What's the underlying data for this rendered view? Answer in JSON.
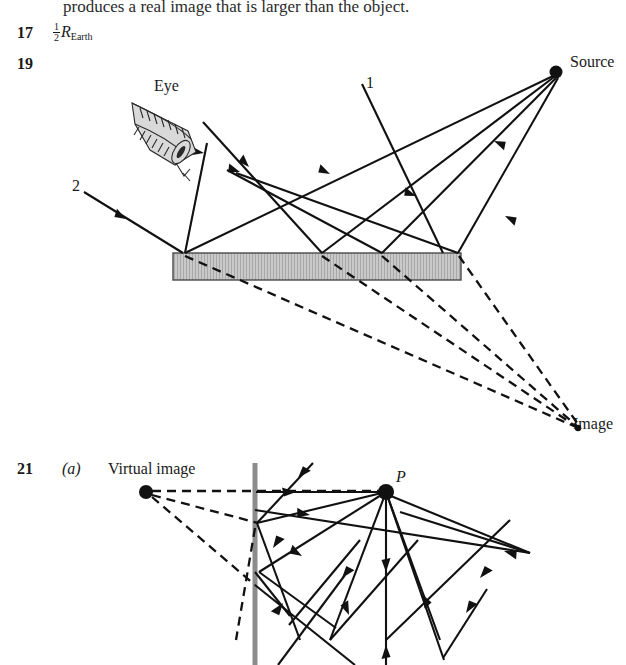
{
  "page": {
    "width": 626,
    "height": 665,
    "background": "#ffffff",
    "ink": "#1a1a1a"
  },
  "cut_off_line": {
    "text": "produces a real image that is larger than the object."
  },
  "answers": [
    {
      "number": "17",
      "formula": {
        "fraction_numerator": "1",
        "fraction_denominator": "2",
        "symbol": "R",
        "subscript": "Earth"
      }
    },
    {
      "number": "19",
      "diagram": {
        "name": "plane-mirror-ray-diagram",
        "labels": {
          "eye": "Eye",
          "source": "Source",
          "image": "Image",
          "ray_one": "1",
          "ray_two": "2"
        },
        "mirror": {
          "fill": "#c9c9c9",
          "stroke": "#4a4a4a"
        },
        "source_point": {
          "x": 556,
          "y": 72
        },
        "image_point": {
          "x": 578,
          "y": 428
        },
        "virtual_rays_style": "dashed"
      }
    },
    {
      "number": "21",
      "part": "(a)",
      "diagram": {
        "name": "virtual-image-point-source-diagram",
        "labels": {
          "virtual_image": "Virtual image",
          "point": "P"
        },
        "mirror": {
          "orientation": "vertical",
          "color": "#8c8c8c"
        },
        "virtual_image_point": {
          "x": 146,
          "y": 492
        },
        "source_point": {
          "x": 386,
          "y": 492
        },
        "virtual_rays_style": "dashed"
      }
    }
  ]
}
